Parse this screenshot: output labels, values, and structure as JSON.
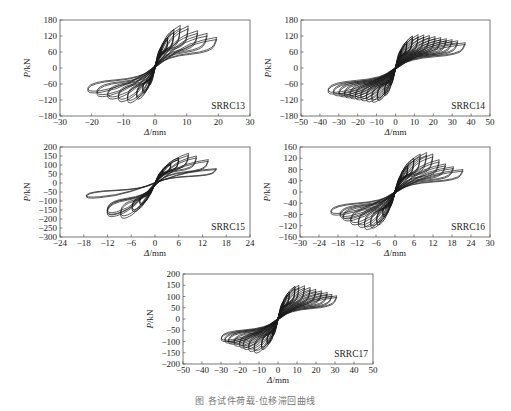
{
  "figure": {
    "caption": "图  各试件荷载-位移滞回曲线"
  },
  "chart_data": [
    {
      "type": "line",
      "title": "SRRC13",
      "xlabel": "Δ/mm",
      "ylabel": "P/kN",
      "xlim": [
        -30,
        30
      ],
      "ylim": [
        -180,
        180
      ],
      "xticks": [
        -30,
        -20,
        -10,
        0,
        10,
        20,
        30
      ],
      "yticks": [
        180,
        120,
        60,
        0,
        -60,
        -120,
        -180
      ],
      "grid": false,
      "legend_position": "bottom-right label",
      "series": [
        {
          "name": "hysteresis loops",
          "cycles": [
            {
              "dpos": 2,
              "ppos": 80,
              "dneg": -2,
              "pneg": -70
            },
            {
              "dpos": 4,
              "ppos": 115,
              "dneg": -4,
              "pneg": -100
            },
            {
              "dpos": 6,
              "ppos": 145,
              "dneg": -6,
              "pneg": -125
            },
            {
              "dpos": 8,
              "ppos": 160,
              "dneg": -9,
              "pneg": -140
            },
            {
              "dpos": 10.5,
              "ppos": 158,
              "dneg": -12,
              "pneg": -135
            },
            {
              "dpos": 13.5,
              "ppos": 140,
              "dneg": -15.5,
              "pneg": -125
            },
            {
              "dpos": 16.5,
              "ppos": 130,
              "dneg": -19,
              "pneg": -115
            },
            {
              "dpos": 19.5,
              "ppos": 115,
              "dneg": -22,
              "pneg": -100
            }
          ]
        }
      ]
    },
    {
      "type": "line",
      "title": "SRRC14",
      "xlabel": "Δ/mm",
      "ylabel": "P/kN",
      "xlim": [
        -50,
        50
      ],
      "ylim": [
        -180,
        180
      ],
      "xticks": [
        -50,
        -40,
        -30,
        -20,
        -10,
        0,
        10,
        20,
        30,
        40,
        50
      ],
      "yticks": [
        180,
        120,
        60,
        0,
        -60,
        -120,
        -180
      ],
      "grid": false,
      "series": [
        {
          "name": "hysteresis loops",
          "cycles": [
            {
              "dpos": 3,
              "ppos": 70,
              "dneg": -3,
              "pneg": -70
            },
            {
              "dpos": 6,
              "ppos": 100,
              "dneg": -6,
              "pneg": -110
            },
            {
              "dpos": 9,
              "ppos": 120,
              "dneg": -10,
              "pneg": -130
            },
            {
              "dpos": 12,
              "ppos": 125,
              "dneg": -13,
              "pneg": -138
            },
            {
              "dpos": 15,
              "ppos": 124,
              "dneg": -16,
              "pneg": -136
            },
            {
              "dpos": 18,
              "ppos": 122,
              "dneg": -19,
              "pneg": -132
            },
            {
              "dpos": 21,
              "ppos": 118,
              "dneg": -22,
              "pneg": -128
            },
            {
              "dpos": 24,
              "ppos": 114,
              "dneg": -25,
              "pneg": -124
            },
            {
              "dpos": 27,
              "ppos": 110,
              "dneg": -28,
              "pneg": -120
            },
            {
              "dpos": 30,
              "ppos": 106,
              "dneg": -31,
              "pneg": -116
            },
            {
              "dpos": 33,
              "ppos": 102,
              "dneg": -34,
              "pneg": -112
            },
            {
              "dpos": 37,
              "ppos": 95,
              "dneg": -37,
              "pneg": -105
            }
          ]
        }
      ]
    },
    {
      "type": "line",
      "title": "SRRC15",
      "xlabel": "Δ/mm",
      "ylabel": "P/kN",
      "xlim": [
        -24,
        24
      ],
      "ylim": [
        -300,
        200
      ],
      "xticks": [
        -24,
        -18,
        -12,
        -6,
        0,
        6,
        12,
        18,
        24
      ],
      "yticks": [
        200,
        150,
        100,
        50,
        0,
        -50,
        -100,
        -150,
        -200,
        -250,
        -300
      ],
      "grid": false,
      "series": [
        {
          "name": "hysteresis loops",
          "cycles": [
            {
              "dpos": 2,
              "ppos": 70,
              "dneg": -2,
              "pneg": -80
            },
            {
              "dpos": 4,
              "ppos": 110,
              "dneg": -4,
              "pneg": -130
            },
            {
              "dpos": 6,
              "ppos": 140,
              "dneg": -6,
              "pneg": -170
            },
            {
              "dpos": 8.5,
              "ppos": 165,
              "dneg": -9,
              "pneg": -210
            },
            {
              "dpos": 10.5,
              "ppos": 150,
              "dneg": -12.5,
              "pneg": -200
            },
            {
              "dpos": 13.5,
              "ppos": 130,
              "dneg": -12.5,
              "pneg": -190
            },
            {
              "dpos": 15.5,
              "ppos": 80,
              "dneg": -18,
              "pneg": -90
            }
          ]
        }
      ]
    },
    {
      "type": "line",
      "title": "SRRC16",
      "xlabel": "Δ/mm",
      "ylabel": "P/kN",
      "xlim": [
        -30,
        30
      ],
      "ylim": [
        -160,
        160
      ],
      "xticks": [
        -30,
        -24,
        -18,
        -12,
        -6,
        0,
        6,
        12,
        18,
        24,
        30
      ],
      "yticks": [
        160,
        120,
        80,
        40,
        0,
        -40,
        -80,
        -120,
        -160
      ],
      "grid": false,
      "series": [
        {
          "name": "hysteresis loops",
          "cycles": [
            {
              "dpos": 2,
              "ppos": 60,
              "dneg": -2,
              "pneg": -60
            },
            {
              "dpos": 4,
              "ppos": 95,
              "dneg": -4,
              "pneg": -95
            },
            {
              "dpos": 6,
              "ppos": 120,
              "dneg": -6,
              "pneg": -125
            },
            {
              "dpos": 8,
              "ppos": 135,
              "dneg": -8,
              "pneg": -138
            },
            {
              "dpos": 10,
              "ppos": 140,
              "dneg": -10,
              "pneg": -143
            },
            {
              "dpos": 12,
              "ppos": 135,
              "dneg": -12,
              "pneg": -135
            },
            {
              "dpos": 14,
              "ppos": 115,
              "dneg": -14.5,
              "pneg": -125
            },
            {
              "dpos": 16,
              "ppos": 100,
              "dneg": -17,
              "pneg": -110
            },
            {
              "dpos": 18.5,
              "ppos": 90,
              "dneg": -18,
              "pneg": -100
            },
            {
              "dpos": 21.5,
              "ppos": 80,
              "dneg": -21,
              "pneg": -88
            }
          ]
        }
      ]
    },
    {
      "type": "line",
      "title": "SRRC17",
      "xlabel": "Δ/mm",
      "ylabel": "P/kN",
      "xlim": [
        -50,
        50
      ],
      "ylim": [
        -200,
        200
      ],
      "xticks": [
        -50,
        -40,
        -30,
        -20,
        -10,
        0,
        10,
        20,
        30,
        40,
        50
      ],
      "yticks": [
        200,
        150,
        100,
        50,
        0,
        -50,
        -100,
        -150,
        -200
      ],
      "grid": false,
      "series": [
        {
          "name": "hysteresis loops",
          "cycles": [
            {
              "dpos": 3,
              "ppos": 80,
              "dneg": -3,
              "pneg": -80
            },
            {
              "dpos": 6,
              "ppos": 120,
              "dneg": -6,
              "pneg": -120
            },
            {
              "dpos": 9,
              "ppos": 145,
              "dneg": -9,
              "pneg": -145
            },
            {
              "dpos": 11,
              "ppos": 150,
              "dneg": -13,
              "pneg": -162
            },
            {
              "dpos": 14,
              "ppos": 148,
              "dneg": -16,
              "pneg": -155
            },
            {
              "dpos": 17,
              "ppos": 140,
              "dneg": -19,
              "pneg": -145
            },
            {
              "dpos": 20,
              "ppos": 132,
              "dneg": -21,
              "pneg": -138
            },
            {
              "dpos": 23,
              "ppos": 125,
              "dneg": -24,
              "pneg": -130
            },
            {
              "dpos": 26,
              "ppos": 118,
              "dneg": -27,
              "pneg": -120
            },
            {
              "dpos": 28.5,
              "ppos": 110,
              "dneg": -29,
              "pneg": -115
            },
            {
              "dpos": 31,
              "ppos": 103,
              "dneg": -31,
              "pneg": -108
            }
          ]
        }
      ]
    }
  ],
  "layout": {
    "panels": [
      {
        "left": 60,
        "top": 20,
        "width": 190,
        "height": 96
      },
      {
        "left": 301,
        "top": 20,
        "width": 189,
        "height": 96
      },
      {
        "left": 60,
        "top": 147,
        "width": 190,
        "height": 90
      },
      {
        "left": 300,
        "top": 147,
        "width": 190,
        "height": 90
      },
      {
        "left": 183,
        "top": 274,
        "width": 190,
        "height": 90
      }
    ]
  }
}
